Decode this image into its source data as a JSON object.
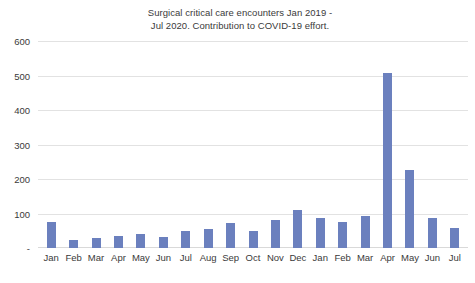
{
  "chart_data": {
    "type": "bar",
    "title": "Surgical critical care encounters Jan 2019 -\nJul 2020. Contribution to COVID-19 effort.",
    "xlabel": "",
    "ylabel": "",
    "ylim": [
      0,
      600
    ],
    "ytick_labels": [
      "600",
      "500",
      "400",
      "300",
      "200",
      "100",
      "-"
    ],
    "ytick_values": [
      600,
      500,
      400,
      300,
      200,
      100,
      0
    ],
    "grid": true,
    "legend": false,
    "series_color": "#6B80BE",
    "categories": [
      "Jan",
      "Feb",
      "Mar",
      "Apr",
      "May",
      "Jun",
      "Jul",
      "Aug",
      "Sep",
      "Oct",
      "Nov",
      "Dec",
      "Jan",
      "Feb",
      "Mar",
      "Apr",
      "May",
      "Jun",
      "Jul"
    ],
    "values": [
      75,
      22,
      30,
      35,
      42,
      33,
      48,
      55,
      72,
      48,
      80,
      110,
      88,
      75,
      92,
      507,
      225,
      88,
      57
    ]
  }
}
